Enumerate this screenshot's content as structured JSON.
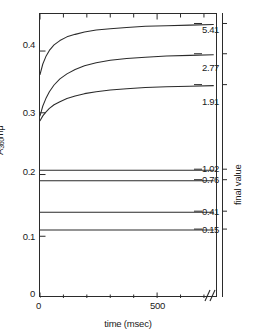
{
  "chart_data": {
    "type": "line",
    "title": "",
    "xlabel": "time (msec)",
    "ylabel": "A360mμ",
    "right_axis_label": "final value",
    "xlim": [
      0,
      760
    ],
    "ylim": [
      0,
      0.46
    ],
    "grid": false,
    "legend": "right-axis-annotations",
    "x_ticks": [
      {
        "value": 0,
        "label": "0",
        "major": true
      },
      {
        "value": 100,
        "label": "",
        "major": false
      },
      {
        "value": 200,
        "label": "",
        "major": false
      },
      {
        "value": 300,
        "label": "",
        "major": false
      },
      {
        "value": 400,
        "label": "",
        "major": false
      },
      {
        "value": 500,
        "label": "500",
        "major": true
      },
      {
        "value": 600,
        "label": "",
        "major": false
      },
      {
        "value": 700,
        "label": "",
        "major": false
      }
    ],
    "y_ticks": [
      {
        "value": 0.0,
        "label": "0"
      },
      {
        "value": 0.1,
        "label": "0.1"
      },
      {
        "value": 0.2,
        "label": "0.2"
      },
      {
        "value": 0.3,
        "label": "0.3"
      },
      {
        "value": 0.4,
        "label": "0.4"
      }
    ],
    "axis_break": {
      "present": true,
      "symbol": "//",
      "x": 700
    },
    "series": [
      {
        "name": "5.41",
        "final_value": "5.41",
        "kind": "rising",
        "x": [
          0,
          12,
          25,
          40,
          60,
          85,
          115,
          150,
          190,
          240,
          300,
          370,
          450,
          540,
          640,
          740
        ],
        "y": [
          0.362,
          0.379,
          0.391,
          0.401,
          0.41,
          0.417,
          0.423,
          0.427,
          0.431,
          0.434,
          0.436,
          0.438,
          0.44,
          0.441,
          0.442,
          0.443
        ]
      },
      {
        "name": "2.77",
        "final_value": "2.77",
        "kind": "rising",
        "x": [
          0,
          12,
          25,
          40,
          60,
          85,
          115,
          150,
          190,
          240,
          300,
          370,
          450,
          540,
          640,
          740
        ],
        "y": [
          0.295,
          0.311,
          0.323,
          0.334,
          0.345,
          0.355,
          0.363,
          0.37,
          0.376,
          0.381,
          0.385,
          0.388,
          0.39,
          0.392,
          0.393,
          0.394
        ]
      },
      {
        "name": "1.91",
        "final_value": "1.91",
        "kind": "rising",
        "x": [
          0,
          12,
          25,
          40,
          60,
          85,
          115,
          150,
          190,
          240,
          300,
          370,
          450,
          540,
          640,
          740
        ],
        "y": [
          0.287,
          0.295,
          0.301,
          0.307,
          0.313,
          0.318,
          0.323,
          0.327,
          0.331,
          0.334,
          0.337,
          0.339,
          0.341,
          0.342,
          0.343,
          0.344
        ]
      },
      {
        "name": "1.02",
        "final_value": "1.02",
        "kind": "flat",
        "x": [
          0,
          740
        ],
        "y": [
          0.207,
          0.207
        ]
      },
      {
        "name": "0.76",
        "final_value": "0.76",
        "kind": "flat",
        "x": [
          0,
          740
        ],
        "y": [
          0.19,
          0.19
        ]
      },
      {
        "name": "0.41",
        "final_value": "0.41",
        "kind": "flat",
        "x": [
          0,
          740
        ],
        "y": [
          0.139,
          0.139
        ]
      },
      {
        "name": "0.15",
        "final_value": "0.15",
        "kind": "flat",
        "x": [
          0,
          740
        ],
        "y": [
          0.11,
          0.11
        ]
      }
    ]
  },
  "axes": {
    "y_left": {
      "title_prefix": "A",
      "title_sub": "360",
      "title_suffix": "mμ",
      "ticks": [
        "0.4",
        "0.3",
        "0.2",
        "0.1",
        "0"
      ]
    },
    "x_bottom": {
      "title": "time (msec)",
      "ticks": [
        "0",
        "500"
      ],
      "break_symbol": "//"
    },
    "y_right": {
      "title": "final value",
      "ticks": [
        "5.41",
        "2.77",
        "1.91",
        "1.02",
        "0.76",
        "0.41",
        "0.15"
      ]
    }
  },
  "style": {
    "line_color": "#2b2b2b",
    "axis_color": "#2b2b2b",
    "background": "#ffffff"
  }
}
